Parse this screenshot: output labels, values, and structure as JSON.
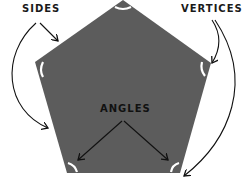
{
  "diagram": {
    "shape_fill": "#5c5c5c",
    "labels": {
      "sides": "SIDES",
      "vertices": "VERTICES",
      "angles": "ANGLES"
    }
  }
}
